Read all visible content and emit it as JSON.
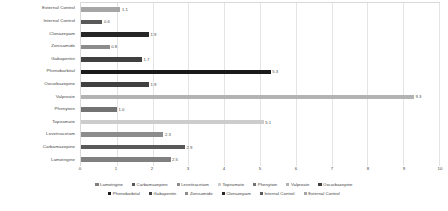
{
  "chart_data": {
    "type": "bar",
    "orientation": "horizontal",
    "title": "",
    "xlabel": "",
    "ylabel": "",
    "xlim": [
      0,
      10
    ],
    "xticks": [
      0,
      1,
      2,
      3,
      4,
      5,
      6,
      7,
      8,
      9,
      10
    ],
    "grid": true,
    "legend_position": "bottom",
    "categories": [
      "External Control",
      "Internal Control",
      "Clonazepam",
      "Zonisamide",
      "Gabapentin",
      "Phenobarbital",
      "Oxcarbazepine",
      "Valproate",
      "Phenytoin",
      "Topiramate",
      "Levetiracetam",
      "Carbamazepine",
      "Lamotrigine"
    ],
    "values": [
      1.1,
      0.6,
      1.9,
      0.8,
      1.7,
      5.3,
      1.9,
      9.3,
      1.0,
      5.1,
      2.3,
      2.9,
      2.5
    ],
    "value_labels": [
      "1.1",
      "0.6",
      "1.9",
      "0.8",
      "1.7",
      "5.3",
      "1.9",
      "9.3",
      "1.0",
      "5.1",
      "2.3",
      "2.9",
      "2.5"
    ],
    "bar_colors": [
      "#a6a6a6",
      "#595959",
      "#262626",
      "#8c8c8c",
      "#404040",
      "#1a1a1a",
      "#404040",
      "#b3b3b3",
      "#737373",
      "#cccccc",
      "#8c8c8c",
      "#595959",
      "#808080"
    ]
  },
  "legend": {
    "rows": [
      [
        {
          "label": "Lamotrigine",
          "color": "#808080"
        },
        {
          "label": "Carbamazepine",
          "color": "#595959"
        },
        {
          "label": "Levetiracetam",
          "color": "#8c8c8c"
        },
        {
          "label": "Topiramate",
          "color": "#cccccc"
        },
        {
          "label": "Phenytoin",
          "color": "#737373"
        },
        {
          "label": "Valproate",
          "color": "#b3b3b3"
        },
        {
          "label": "Oxcarbazepine",
          "color": "#404040"
        }
      ],
      [
        {
          "label": "Phenobarbital",
          "color": "#1a1a1a"
        },
        {
          "label": "Gabapentin",
          "color": "#404040"
        },
        {
          "label": "Zonisamide",
          "color": "#8c8c8c"
        },
        {
          "label": "Clonazepam",
          "color": "#262626"
        },
        {
          "label": "Internal Control",
          "color": "#595959"
        },
        {
          "label": "External Control",
          "color": "#a6a6a6"
        }
      ]
    ]
  }
}
